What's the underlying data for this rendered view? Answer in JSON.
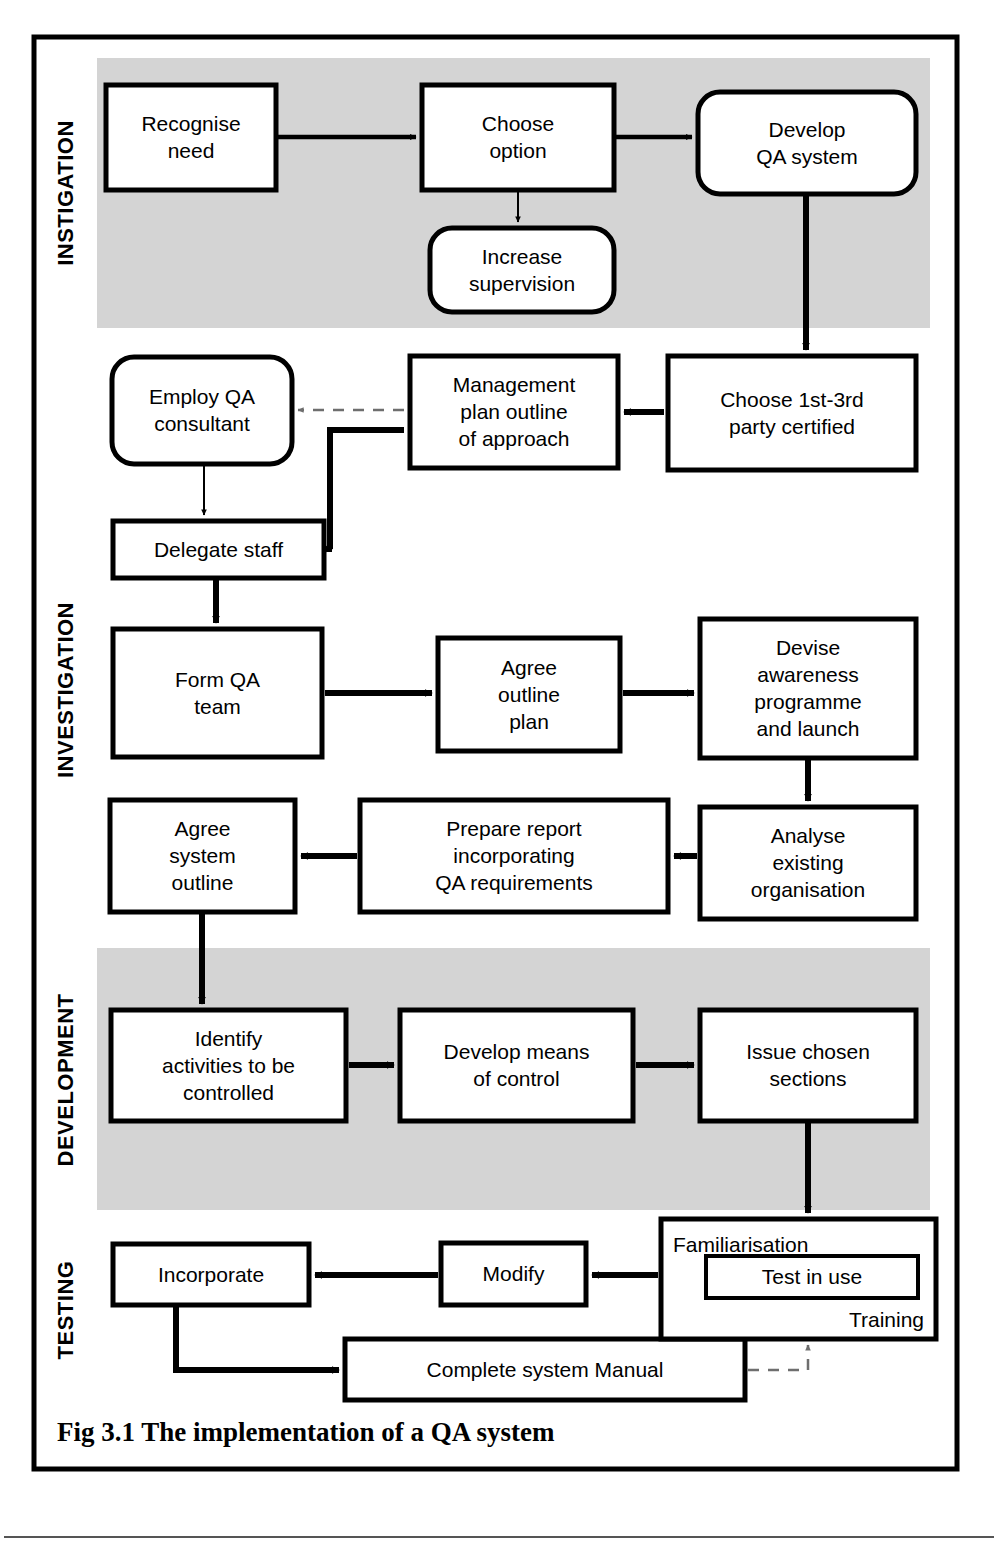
{
  "figure": {
    "caption": "Fig 3.1 The implementation of a QA system",
    "border_color": "#000000",
    "shade_color": "#d4d4d4"
  },
  "sections": [
    {
      "id": "instigation",
      "label": "INSTIGATION",
      "shaded": true,
      "band": {
        "x": 97,
        "y": 58,
        "w": 833,
        "h": 270
      },
      "label_center_y": 193
    },
    {
      "id": "investigation",
      "label": "INVESTIGATION",
      "shaded": false,
      "band": {
        "x": 97,
        "y": 340,
        "w": 833,
        "h": 600
      },
      "label_center_y": 690
    },
    {
      "id": "development",
      "label": "DEVELOPMENT",
      "shaded": true,
      "band": {
        "x": 97,
        "y": 948,
        "w": 833,
        "h": 262
      },
      "label_center_y": 1080
    },
    {
      "id": "testing",
      "label": "TESTING",
      "shaded": false,
      "band": {
        "x": 97,
        "y": 1215,
        "w": 833,
        "h": 170
      },
      "label_center_y": 1310
    }
  ],
  "nodes": [
    {
      "id": "recognise-need",
      "lines": [
        "Recognise",
        "need"
      ],
      "shape": "rect",
      "x": 106,
      "y": 85,
      "w": 170,
      "h": 105,
      "align": "center"
    },
    {
      "id": "choose-option",
      "lines": [
        "Choose",
        "option"
      ],
      "shape": "rect",
      "x": 422,
      "y": 85,
      "w": 192,
      "h": 105,
      "align": "center"
    },
    {
      "id": "develop-qa-system",
      "lines": [
        "Develop",
        "QA system"
      ],
      "shape": "round",
      "x": 698,
      "y": 92,
      "w": 218,
      "h": 102,
      "align": "center"
    },
    {
      "id": "increase-supervision",
      "lines": [
        "Increase",
        "supervision"
      ],
      "shape": "round",
      "x": 430,
      "y": 228,
      "w": 184,
      "h": 84,
      "align": "center"
    },
    {
      "id": "employ-qa-consultant",
      "lines": [
        "Employ QA",
        "consultant"
      ],
      "shape": "round",
      "x": 112,
      "y": 357,
      "w": 180,
      "h": 107,
      "align": "center"
    },
    {
      "id": "management-plan-outline",
      "lines": [
        "Management",
        "plan outline",
        "of approach"
      ],
      "shape": "rect",
      "x": 410,
      "y": 356,
      "w": 208,
      "h": 112,
      "align": "center"
    },
    {
      "id": "choose-party-certified",
      "lines": [
        "Choose 1st-3rd",
        "party certified"
      ],
      "shape": "rect",
      "x": 668,
      "y": 356,
      "w": 248,
      "h": 114,
      "align": "center"
    },
    {
      "id": "delegate-staff",
      "lines": [
        "Delegate staff"
      ],
      "shape": "rect",
      "x": 113,
      "y": 521,
      "w": 211,
      "h": 57,
      "align": "center"
    },
    {
      "id": "form-qa-team",
      "lines": [
        "Form QA",
        "team"
      ],
      "shape": "rect",
      "x": 113,
      "y": 629,
      "w": 209,
      "h": 128,
      "align": "center"
    },
    {
      "id": "agree-outline-plan",
      "lines": [
        "Agree",
        "outline",
        "plan"
      ],
      "shape": "rect",
      "x": 438,
      "y": 638,
      "w": 182,
      "h": 113,
      "align": "center"
    },
    {
      "id": "devise-awareness",
      "lines": [
        "Devise",
        "awareness",
        "programme",
        "and launch"
      ],
      "shape": "rect",
      "x": 700,
      "y": 619,
      "w": 216,
      "h": 139,
      "align": "center"
    },
    {
      "id": "analyse-existing",
      "lines": [
        "Analyse",
        "existing",
        "organisation"
      ],
      "shape": "rect",
      "x": 700,
      "y": 807,
      "w": 216,
      "h": 112,
      "align": "center"
    },
    {
      "id": "prepare-report",
      "lines": [
        "Prepare report",
        "incorporating",
        "QA requirements"
      ],
      "shape": "rect",
      "x": 360,
      "y": 800,
      "w": 308,
      "h": 112,
      "align": "center"
    },
    {
      "id": "agree-system-outline",
      "lines": [
        "Agree",
        "system",
        "outline"
      ],
      "shape": "rect",
      "x": 110,
      "y": 800,
      "w": 185,
      "h": 112,
      "align": "center"
    },
    {
      "id": "identify-activities",
      "lines": [
        "Identify",
        "activities to be",
        "controlled"
      ],
      "shape": "rect",
      "x": 111,
      "y": 1010,
      "w": 235,
      "h": 111,
      "align": "center"
    },
    {
      "id": "develop-means-control",
      "lines": [
        "Develop means",
        "of control"
      ],
      "shape": "rect",
      "x": 400,
      "y": 1010,
      "w": 233,
      "h": 111,
      "align": "center"
    },
    {
      "id": "issue-chosen-sections",
      "lines": [
        "Issue chosen",
        "sections"
      ],
      "shape": "rect",
      "x": 700,
      "y": 1010,
      "w": 216,
      "h": 111,
      "align": "center"
    },
    {
      "id": "incorporate",
      "lines": [
        "Incorporate"
      ],
      "shape": "rect",
      "x": 113,
      "y": 1244,
      "w": 196,
      "h": 61,
      "align": "center"
    },
    {
      "id": "modify",
      "lines": [
        "Modify"
      ],
      "shape": "rect",
      "x": 441,
      "y": 1243,
      "w": 145,
      "h": 62,
      "align": "center"
    },
    {
      "id": "complete-system-manual",
      "lines": [
        "Complete system Manual"
      ],
      "shape": "rect",
      "x": 345,
      "y": 1339,
      "w": 400,
      "h": 61,
      "align": "center"
    }
  ],
  "composite_node": {
    "id": "familiarisation-group",
    "outer": {
      "x": 661,
      "y": 1219,
      "w": 275,
      "h": 120
    },
    "top_label": "Familiarisation",
    "bottom_label": "Training",
    "inner": {
      "id": "test-in-use",
      "label": "Test in use",
      "x": 706,
      "y": 1256,
      "w": 212,
      "h": 42
    }
  },
  "edges": [
    {
      "id": "e-recognise-to-choose",
      "style": "solid-thin",
      "points": "278,137 416,137",
      "arrow": "end"
    },
    {
      "id": "e-choose-to-develop",
      "style": "solid-thin",
      "points": "616,137 692,137",
      "arrow": "end"
    },
    {
      "id": "e-choose-to-increase",
      "style": "solid-hair",
      "points": "518,192 518,222",
      "arrow": "end"
    },
    {
      "id": "e-develop-to-choose-party",
      "style": "solid-thick",
      "points": "806,196 806,350",
      "arrow": "end"
    },
    {
      "id": "e-party-to-management",
      "style": "solid-thick",
      "points": "664,412 624,412",
      "arrow": "end"
    },
    {
      "id": "e-management-to-employ",
      "style": "dashed",
      "points": "404,410 298,410",
      "arrow": "end"
    },
    {
      "id": "e-employ-to-delegate",
      "style": "solid-hair",
      "points": "204,466 204,515",
      "arrow": "end"
    },
    {
      "id": "e-management-to-delegate",
      "style": "solid-thick",
      "points": "404,430 330,430 330,549 332,549",
      "arrow": "end"
    },
    {
      "id": "e-delegate-to-form",
      "style": "solid-thick",
      "points": "216,580 216,623",
      "arrow": "end"
    },
    {
      "id": "e-form-to-agree-plan",
      "style": "solid-thick",
      "points": "325,693 432,693",
      "arrow": "end"
    },
    {
      "id": "e-agree-plan-to-devise",
      "style": "solid-thick",
      "points": "623,693 694,693",
      "arrow": "end"
    },
    {
      "id": "e-devise-to-analyse",
      "style": "solid-thick",
      "points": "808,760 808,801",
      "arrow": "end"
    },
    {
      "id": "e-analyse-to-prepare",
      "style": "solid-thick",
      "points": "697,856 674,856",
      "arrow": "end"
    },
    {
      "id": "e-prepare-to-agree-system",
      "style": "solid-thick",
      "points": "357,856 301,856",
      "arrow": "end"
    },
    {
      "id": "e-agree-system-to-identify",
      "style": "solid-thick",
      "points": "202,914 202,1004",
      "arrow": "end"
    },
    {
      "id": "e-identify-to-develop-means",
      "style": "solid-thick",
      "points": "349,1065 394,1065",
      "arrow": "end"
    },
    {
      "id": "e-develop-means-to-issue",
      "style": "solid-thick",
      "points": "636,1065 694,1065",
      "arrow": "end"
    },
    {
      "id": "e-issue-to-familiarisation",
      "style": "solid-thick",
      "points": "808,1123 808,1213",
      "arrow": "end"
    },
    {
      "id": "e-familiarisation-to-modify",
      "style": "solid-thick",
      "points": "658,1275 592,1275",
      "arrow": "end"
    },
    {
      "id": "e-modify-to-incorporate",
      "style": "solid-thick",
      "points": "438,1275 315,1275",
      "arrow": "end"
    },
    {
      "id": "e-incorporate-to-manual",
      "style": "solid-thick",
      "points": "176,1307 176,1370 339,1370",
      "arrow": "end"
    },
    {
      "id": "e-manual-to-familiarisation",
      "style": "dashed",
      "points": "748,1370 808,1370 808,1345",
      "arrow": "end"
    }
  ]
}
